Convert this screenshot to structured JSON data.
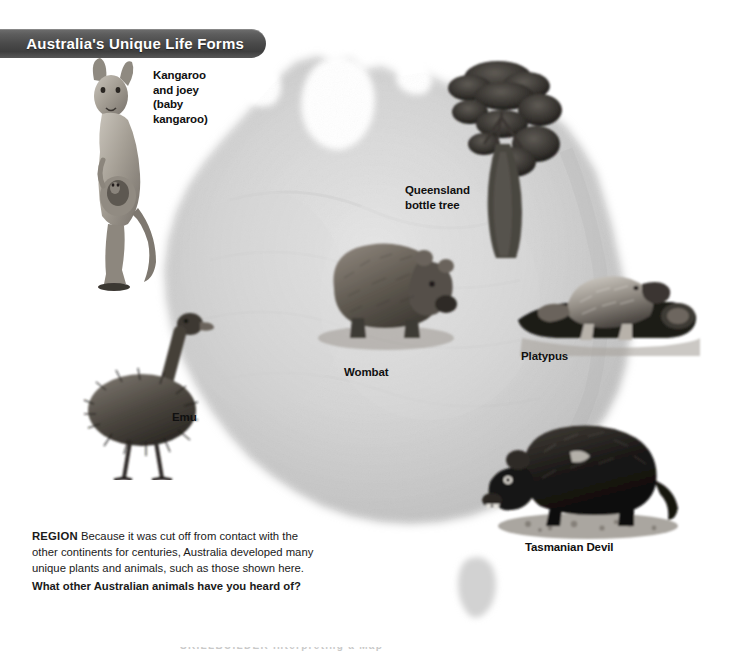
{
  "banner": {
    "title": "Australia's Unique Life Forms",
    "background_color": "#4a4a4a",
    "text_color": "#ffffff"
  },
  "map": {
    "name": "Australia relief map",
    "land_color": "#d8d8d8",
    "background_color": "#ffffff"
  },
  "labels": {
    "kangaroo": "Kangaroo\nand joey\n(baby\nkangaroo)",
    "bottle_tree": "Queensland\nbottle tree",
    "wombat": "Wombat",
    "platypus": "Platypus",
    "emu": "Emu",
    "tasmanian_devil": "Tasmanian Devil"
  },
  "caption": {
    "region_tag": "REGION",
    "body": " Because it was cut off from contact with the other continents for centuries, Australia developed many unique plants and animals, such as those shown here.",
    "question": "What other Australian animals have you heard of?"
  },
  "footer": {
    "clipped_text": "SKILLBUILDER  Interpreting a Map"
  }
}
